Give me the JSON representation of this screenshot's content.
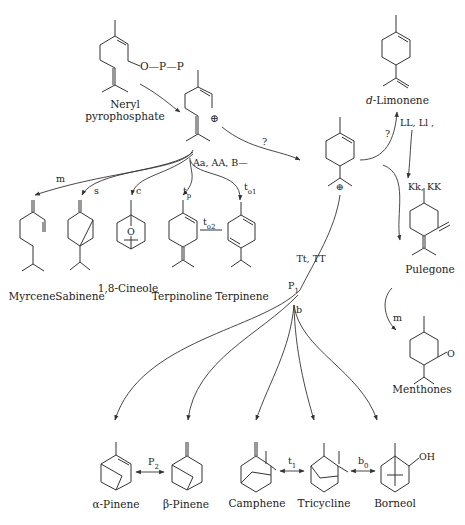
{
  "diagram": {
    "type": "terpene-biosynthesis-pathway",
    "compounds": {
      "neryl_pp_label_1": "Neryl",
      "neryl_pp_label_2": "pyrophosphate",
      "neryl_pp_group": "O—P—P",
      "limonene": "d-Limonene",
      "limonene_prefix": "d",
      "limonene_name": "-Limonene",
      "myrcene": "Myrcene",
      "sabinene": "Sabinene",
      "cineole": "1,8-Cineole",
      "cineole_atom": "O",
      "terpinoline": "Terpinoline",
      "terpinene": "Terpinene",
      "pulegone": "Pulegone",
      "menthones": "Menthones",
      "menthone_atom": "O",
      "alpha_pinene": "α-Pinene",
      "beta_pinene": "β-Pinene",
      "camphene": "Camphene",
      "tricycline": "Tricycline",
      "borneol": "Borneol",
      "borneol_group": "OH"
    },
    "cation_symbol": "⊕",
    "gene_labels": {
      "neryl_branch": "Aa, AA, B—",
      "to_cation": "?",
      "to_limonene": "?",
      "limonene_genes": "LL, Ll ,",
      "pulegone_genes": "Kk, KK",
      "pulegone_to_menthone": "m",
      "pinane_genes": "Tt, TT",
      "myrcene": "m",
      "sabinene": "s",
      "cineole": "c",
      "terpinoline": "t",
      "terpinoline_sub": "p",
      "terpinene": "t",
      "terpinene_sub": "o1",
      "terpinoline_terpinene": "t",
      "terpinoline_terpinene_sub": "o2",
      "p1": "P",
      "p1_sub": "1",
      "b": "b",
      "p2": "P",
      "p2_sub": "2",
      "t1": "t",
      "t1_sub": "1",
      "b0": "b",
      "b0_sub": "0"
    }
  }
}
